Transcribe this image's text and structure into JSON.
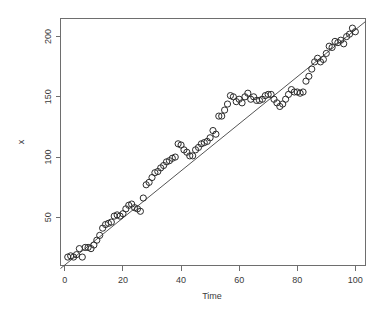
{
  "figure": {
    "background_color": "#ffffff",
    "point_color": "#2b2b2b",
    "line_color": "#555555",
    "axis_color": "#6e6e6e",
    "text_color": "#3a3a3a"
  },
  "chart_data": {
    "type": "scatter",
    "title": "",
    "subtitle": "",
    "xlabel": "Time",
    "ylabel": "x",
    "xlim": [
      -1.5,
      103.5
    ],
    "ylim": [
      10,
      215
    ],
    "grid": false,
    "legend": null,
    "xticks": [
      0,
      20,
      40,
      60,
      80,
      100
    ],
    "xtick_labels": [
      "0",
      "20",
      "40",
      "60",
      "80",
      "100"
    ],
    "yticks": [
      50,
      100,
      150,
      200
    ],
    "ytick_labels": [
      "50",
      "100",
      "150",
      "200"
    ],
    "marker": "open-circle",
    "marker_size": 3.1,
    "annotations": [],
    "fit_line": {
      "type": "linear",
      "slope": 1.952,
      "intercept": 10.4,
      "x_start": -1.5,
      "x_end": 103.5,
      "y_start": 7.5,
      "y_end": 212.5
    },
    "series": [
      {
        "name": "x",
        "x": [
          1,
          2,
          3,
          4,
          5,
          6,
          7,
          8,
          9,
          10,
          11,
          12,
          13,
          14,
          15,
          16,
          17,
          18,
          19,
          20,
          21,
          22,
          23,
          24,
          25,
          26,
          27,
          28,
          29,
          30,
          31,
          32,
          33,
          34,
          35,
          36,
          37,
          38,
          39,
          40,
          41,
          42,
          43,
          44,
          45,
          46,
          47,
          48,
          49,
          50,
          51,
          52,
          53,
          54,
          55,
          56,
          57,
          58,
          59,
          60,
          61,
          62,
          63,
          64,
          65,
          66,
          67,
          68,
          69,
          70,
          71,
          72,
          73,
          74,
          75,
          76,
          77,
          78,
          79,
          80,
          81,
          82,
          83,
          84,
          85,
          86,
          87,
          88,
          89,
          90,
          91,
          92,
          93,
          94,
          95,
          96,
          97,
          98,
          99,
          100
        ],
        "y": [
          17,
          18,
          17,
          19,
          24,
          17,
          25,
          25,
          24,
          27,
          31,
          35,
          41,
          44,
          45,
          46,
          51,
          52,
          51,
          53,
          57,
          60,
          61,
          58,
          57,
          55,
          66,
          77,
          79,
          83,
          87,
          88,
          91,
          93,
          96,
          97,
          99,
          100,
          111,
          110,
          106,
          104,
          101,
          101,
          106,
          108,
          111,
          112,
          113,
          116,
          122,
          119,
          134,
          134,
          139,
          144,
          151,
          150,
          146,
          148,
          145,
          150,
          153,
          148,
          150,
          147,
          147,
          148,
          151,
          152,
          152,
          148,
          145,
          142,
          144,
          148,
          152,
          156,
          154,
          154,
          153,
          154,
          163,
          167,
          173,
          179,
          182,
          179,
          181,
          186,
          192,
          191,
          196,
          195,
          197,
          194,
          200,
          202,
          207,
          204
        ]
      }
    ]
  }
}
